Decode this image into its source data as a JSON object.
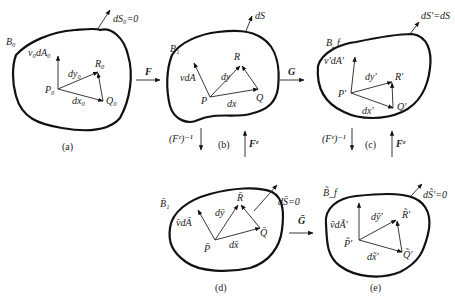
{
  "figure": {
    "panels": [
      {
        "id": "a",
        "caption": "(a)",
        "body_label": "B₀",
        "normal_label": "v₀dA₀",
        "surface_label": "dS₀=0",
        "point_P": "P₀",
        "point_Q": "Q₀",
        "point_R": "R₀",
        "vec_dx": "dx₀",
        "vec_dy": "dy₀"
      },
      {
        "id": "b",
        "caption": "(b)",
        "body_label": "B₁",
        "normal_label": "vdA",
        "surface_label": "dS",
        "point_P": "P",
        "point_Q": "Q",
        "point_R": "R",
        "vec_dx": "dx",
        "vec_dy": "dy"
      },
      {
        "id": "c",
        "caption": "(c)",
        "body_label": "B_f",
        "normal_label": "v′dA′",
        "surface_label": "dS′=dS",
        "point_P": "P′",
        "point_Q": "Q′",
        "point_R": "R′",
        "vec_dx": "dx′",
        "vec_dy": "dy′"
      },
      {
        "id": "d",
        "caption": "(d)",
        "body_label": "B̄₁",
        "normal_label": "v̄dĀ",
        "surface_label": "dS̄=0",
        "point_P": "P̄",
        "point_Q": "Q̄",
        "point_R": "R̄",
        "vec_dx": "dx̄",
        "vec_dy": "dȳ"
      },
      {
        "id": "e",
        "caption": "(e)",
        "body_label": "B̃_f",
        "normal_label": "ṽdÃ′",
        "surface_label": "dS̃′=0",
        "point_P": "P̃′",
        "point_Q": "Q̃′",
        "point_R": "R̃′",
        "vec_dx": "dx̃′",
        "vec_dy": "dỹ′"
      }
    ],
    "maps": {
      "a_to_b": "F",
      "b_to_c": "G",
      "d_to_e": "Ḡ",
      "b_down": "(Fᵉ)⁻¹",
      "b_up": "Fᵉ",
      "c_down": "(Fᵉ)⁻¹",
      "c_up": "Fᵉ"
    }
  }
}
